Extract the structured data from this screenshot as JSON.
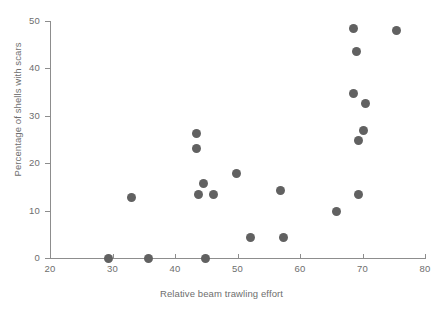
{
  "chart_data": {
    "type": "scatter",
    "title": "",
    "xlabel": "Relative beam trawling effort",
    "ylabel": "Percentage of shells with scars",
    "xlim": [
      20,
      80
    ],
    "ylim": [
      0,
      50
    ],
    "xticks": [
      20,
      30,
      40,
      50,
      60,
      70,
      80
    ],
    "yticks": [
      0,
      10,
      20,
      30,
      40,
      50
    ],
    "grid": false,
    "legend": null,
    "marker": {
      "shape": "circle",
      "color": "#616161",
      "size": 9
    },
    "points": [
      {
        "x": 29.4,
        "y": 0.0
      },
      {
        "x": 33.0,
        "y": 12.7
      },
      {
        "x": 35.7,
        "y": 0.0
      },
      {
        "x": 43.4,
        "y": 26.2
      },
      {
        "x": 43.4,
        "y": 23.2
      },
      {
        "x": 43.7,
        "y": 13.5
      },
      {
        "x": 44.6,
        "y": 15.8
      },
      {
        "x": 44.8,
        "y": 0.0
      },
      {
        "x": 46.2,
        "y": 13.5
      },
      {
        "x": 49.8,
        "y": 17.9
      },
      {
        "x": 52.0,
        "y": 4.4
      },
      {
        "x": 56.8,
        "y": 14.3
      },
      {
        "x": 57.4,
        "y": 4.4
      },
      {
        "x": 65.8,
        "y": 9.9
      },
      {
        "x": 68.5,
        "y": 48.5
      },
      {
        "x": 69.0,
        "y": 43.5
      },
      {
        "x": 69.3,
        "y": 13.5
      },
      {
        "x": 68.5,
        "y": 34.8
      },
      {
        "x": 70.4,
        "y": 32.5
      },
      {
        "x": 70.2,
        "y": 26.8
      },
      {
        "x": 69.4,
        "y": 24.7
      },
      {
        "x": 75.4,
        "y": 48.0
      }
    ]
  },
  "axes": {
    "y_tick_labels": [
      "0",
      "10",
      "20",
      "30",
      "40",
      "50"
    ],
    "x_tick_labels": [
      "20",
      "30",
      "40",
      "50",
      "60",
      "70",
      "80"
    ],
    "y_axis_title": "Percentage of shells with scars",
    "x_axis_title": "Relative beam trawling effort"
  },
  "colors": {
    "marker": "#616161",
    "axis": "#8d8d8d",
    "text": "#6e6e6e",
    "background": "#ffffff"
  }
}
